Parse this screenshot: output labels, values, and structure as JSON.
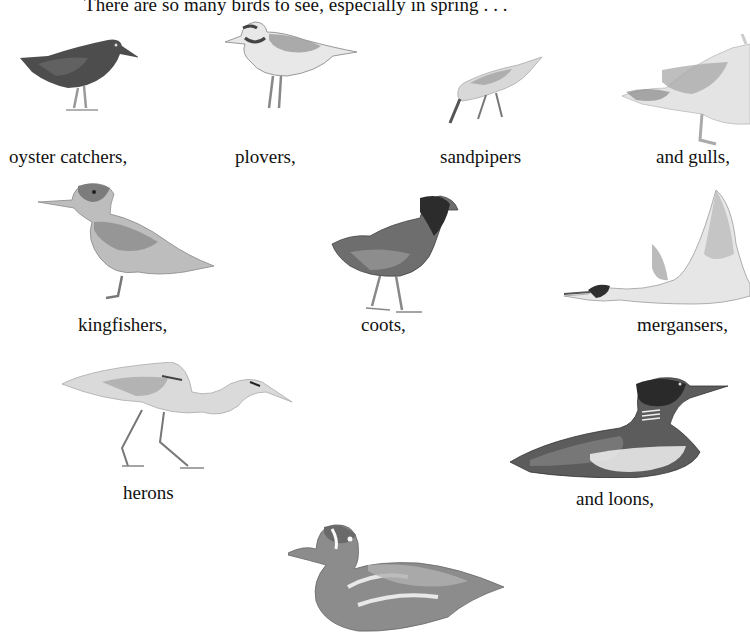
{
  "page": {
    "intro_text": "There are so many birds to see, especially in spring . . ."
  },
  "birds": [
    {
      "name": "oyster catcher",
      "caption": "oyster catchers,"
    },
    {
      "name": "plover",
      "caption": "plovers,"
    },
    {
      "name": "sandpiper",
      "caption": "sandpipers"
    },
    {
      "name": "gull",
      "caption": "and gulls,"
    },
    {
      "name": "kingfisher",
      "caption": "kingfishers,"
    },
    {
      "name": "coot",
      "caption": "coots,"
    },
    {
      "name": "merganser",
      "caption": "mergansers,"
    },
    {
      "name": "heron",
      "caption": "herons"
    },
    {
      "name": "loon",
      "caption": "and loons,"
    },
    {
      "name": "duck",
      "caption": ""
    }
  ],
  "colors": {
    "background": "#ffffff",
    "text": "#111111",
    "ink_dark": "#2a2a2a",
    "ink_mid": "#7a7a7a",
    "ink_light": "#c4c4c4"
  }
}
